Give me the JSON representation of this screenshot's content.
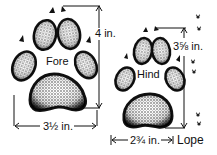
{
  "diagram": {
    "fore": {
      "label": "Fore",
      "height_label": "4 in.",
      "width_label": "3½ in."
    },
    "hind": {
      "label": "Hind",
      "height_label": "3⅝ in.",
      "width_label": "2¾ in."
    },
    "gait": {
      "label": "Lope"
    },
    "colors": {
      "ink": "#111111",
      "background": "#ffffff"
    }
  }
}
